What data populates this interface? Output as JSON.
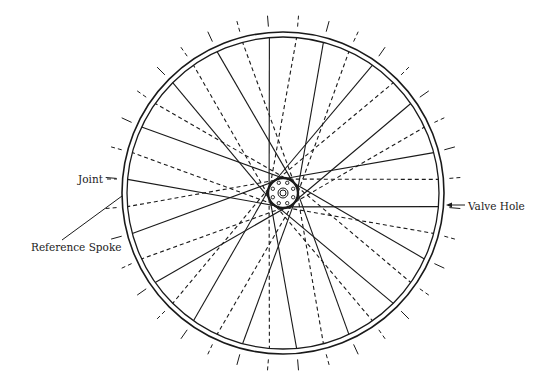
{
  "figure": {
    "type": "bicycle wheel spoke lacing diagram",
    "labels": {
      "joint": "Joint",
      "reference_spoke": "Reference Spoke",
      "valve_hole": "Valve Hole"
    }
  },
  "diagram_data": {
    "center": [
      283,
      193
    ],
    "rim_outer_radius": 161,
    "rim_inner_radius": 156,
    "spoke_count": 36,
    "hub_flange_radius": 15,
    "hub_hole_ring_radius": 11,
    "hub_hole_count": 8,
    "hub_axle_radii": [
      5,
      3
    ],
    "tick_inner_radius": 167,
    "tick_outer_radius": 178,
    "stroke_color": "#1a1a1a",
    "cross_offset_degrees": 60
  }
}
